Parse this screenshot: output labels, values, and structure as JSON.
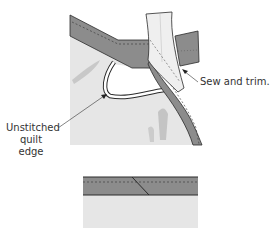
{
  "diagram": {
    "labels": {
      "sew_and_trim": "Sew and trim.",
      "unstitched_line1": "Unstitched",
      "unstitched_line2": "quilt edge"
    },
    "colors": {
      "quilt": "#e6e6e6",
      "binding_dark": "#8c8c8c",
      "binding_light": "#efefef",
      "outline": "#2b2b2b",
      "background": "#ffffff"
    }
  }
}
